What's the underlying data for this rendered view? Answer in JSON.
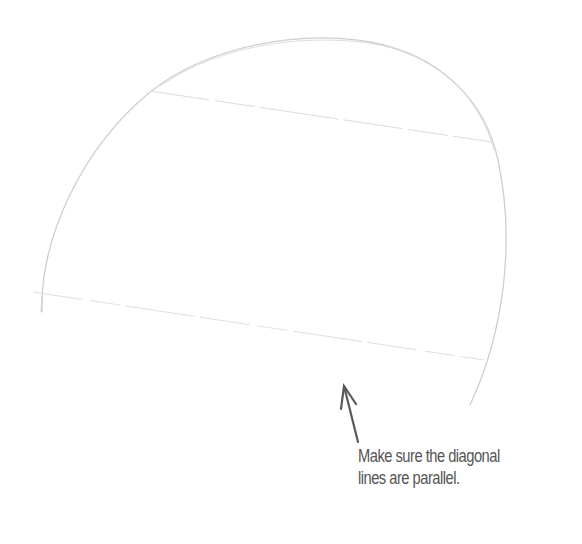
{
  "illustration": {
    "subject": "pencil sketch of a tilted circle with two parallel diagonal guide lines",
    "colors": {
      "background": "#ffffff",
      "pencil_stroke": "#cfcfcf",
      "guide_line": "#dcdcdc",
      "arrow": "#5a5a5a",
      "caption_text": "#555555"
    },
    "shapes": {
      "arc": "M 42 312 C 40 240, 80 150, 150 92 C 210 45, 300 30, 370 42 C 440 55, 485 100, 498 160 C 515 240, 505 330, 470 405",
      "upper_guide_line": {
        "x1": 150,
        "y1": 91,
        "x2": 492,
        "y2": 142
      },
      "lower_guide_line": {
        "x1": 33,
        "y1": 292,
        "x2": 484,
        "y2": 360
      },
      "arrow": {
        "tail_x": 358,
        "tail_y": 442,
        "tip_x": 344,
        "tip_y": 386
      }
    }
  },
  "annotation": {
    "line1": "Make sure the diagonal",
    "line2": "lines are parallel."
  }
}
